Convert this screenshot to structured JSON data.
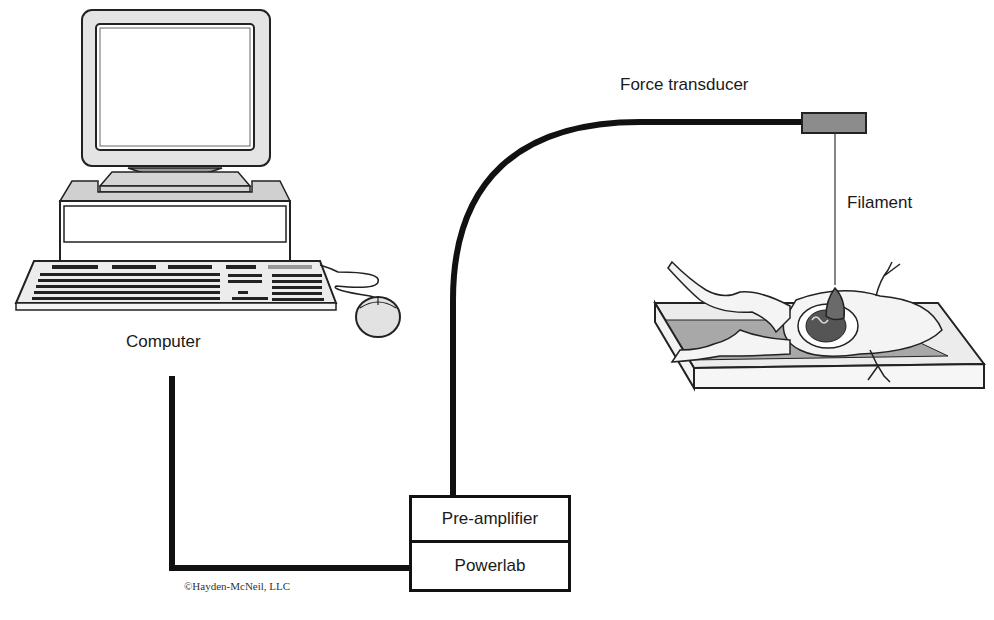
{
  "diagram": {
    "components": {
      "computer": {
        "label": "Computer"
      },
      "force_transducer": {
        "label": "Force transducer"
      },
      "filament": {
        "label": "Filament"
      },
      "pre_amplifier": {
        "label": "Pre-amplifier"
      },
      "powerlab": {
        "label": "Powerlab"
      }
    },
    "copyright": "©Hayden-McNeil, LLC",
    "colors": {
      "cable": "#111111",
      "transducer_fill": "#8a8a8a",
      "tray_fill": "#e6e6e6",
      "tray_inner": "#a9a9a9",
      "monitor_fill": "#dcdcdc"
    },
    "connections": [
      {
        "from": "computer",
        "to": "powerlab"
      },
      {
        "from": "pre_amplifier",
        "to": "force_transducer"
      },
      {
        "from": "force_transducer",
        "to": "frog_heart",
        "via": "filament"
      }
    ]
  }
}
